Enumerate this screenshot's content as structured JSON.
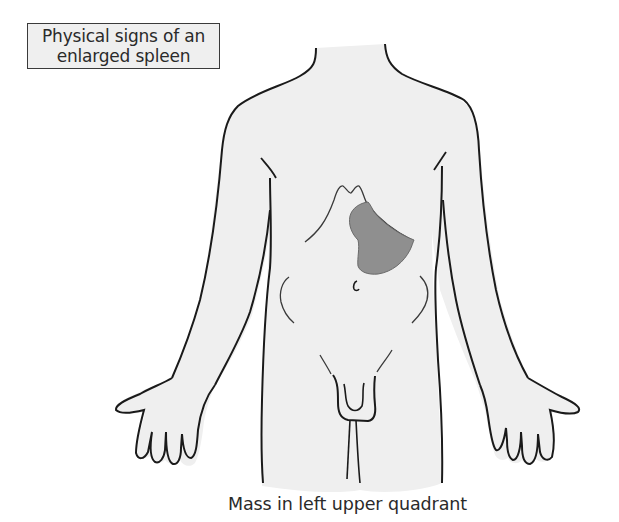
{
  "title": {
    "line1": "Physical signs of an",
    "line2": "enlarged spleen"
  },
  "caption": "Mass in left upper quadrant",
  "figure": {
    "highlighted_organ": "enlarged spleen",
    "region": "left upper quadrant"
  },
  "colors": {
    "body_fill": "#efefef",
    "outline": "#1a1a1a",
    "spleen_fill": "#8f8f8f",
    "spleen_stroke": "#6a6a6a",
    "title_box_fill": "#efefef",
    "text": "#2a2a2a"
  }
}
